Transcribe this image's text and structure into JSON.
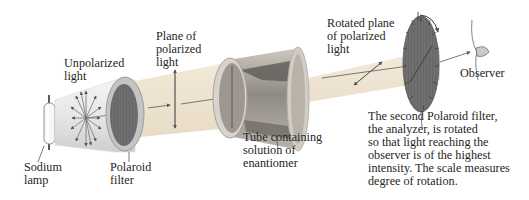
{
  "diagram": {
    "labels": {
      "unpolarized_light": [
        "Unpolarized",
        "light"
      ],
      "plane_of_polarized_light": [
        "Plane of",
        "polarized",
        "light"
      ],
      "rotated_plane": [
        "Rotated plane",
        "of polarized",
        "light"
      ],
      "observer": [
        "Observer"
      ],
      "sodium_lamp": [
        "Sodium",
        "lamp"
      ],
      "polaroid_filter": [
        "Polaroid",
        "filter"
      ],
      "tube": [
        "Tube containing",
        "solution of",
        "enantiomer"
      ],
      "analyzer_caption": [
        "The second Polaroid filter,",
        "the analyzer, is rotated",
        "so that light reaching the",
        "observer is of the highest",
        "intensity. The scale measures",
        "degree of rotation."
      ]
    },
    "components": [
      "sodium-lamp",
      "unpolarized-light-cone",
      "polaroid-filter",
      "polarized-light-beam",
      "sample-tube",
      "rotated-light-beam",
      "analyzer-disc",
      "observer-eye"
    ],
    "colors": {
      "beam": "#f1e6d3",
      "beam_edge": "#e0d2bb",
      "tube_body": "#8a8a8a",
      "filter_dark": "#6e6e6e",
      "filter_rim": "#bdbdbd",
      "arrow": "#555555",
      "text": "#262626"
    }
  }
}
